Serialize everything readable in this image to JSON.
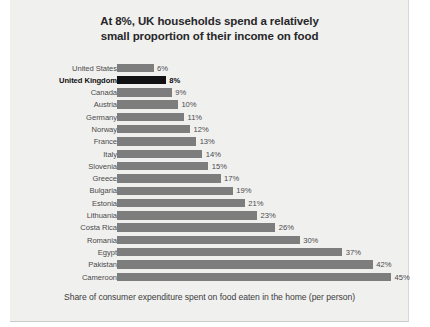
{
  "chart_data": {
    "type": "bar",
    "orientation": "horizontal",
    "title": "At 8%, UK households spend a relatively small proportion of their income on food",
    "title_lines": [
      "At 8%, UK households spend a relatively",
      "small proportion of their income on food"
    ],
    "footnote": "Share of consumer expenditure spent on food eaten in the home (per person)",
    "xlabel": "",
    "ylabel": "",
    "grid": false,
    "legend": "none",
    "axis_visible": false,
    "value_suffix": "%",
    "xlim": [
      0,
      45
    ],
    "categories": [
      "United States",
      "United Kingdom",
      "Canada",
      "Austria",
      "Germany",
      "Norway",
      "France",
      "Italy",
      "Slovenia",
      "Greece",
      "Bulgaria",
      "Estonia",
      "Lithuania",
      "Costa Rica",
      "Romania",
      "Egypt",
      "Pakistan",
      "Cameroon"
    ],
    "values": [
      6,
      8,
      9,
      10,
      11,
      12,
      13,
      14,
      15,
      17,
      19,
      21,
      23,
      26,
      30,
      37,
      42,
      45
    ],
    "value_labels": [
      "6%",
      "8%",
      "9%",
      "10%",
      "11%",
      "12%",
      "13%",
      "14%",
      "15%",
      "17%",
      "19%",
      "21%",
      "23%",
      "26%",
      "30%",
      "37%",
      "42%",
      "45%"
    ],
    "highlight_category": "United Kingdom",
    "highlight_index": 1,
    "colors": {
      "bar": "#7d7d7d",
      "bar_highlight": "#111113",
      "background": "#f0f0ee",
      "title_text": "#27272a",
      "label_text": "#4a4a4d",
      "highlight_text": "#101012",
      "footnote_text": "#3c3c3f"
    }
  }
}
